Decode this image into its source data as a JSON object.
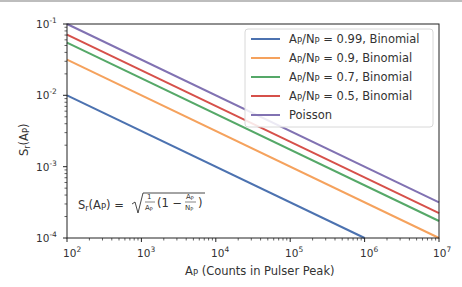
{
  "chart_data": {
    "type": "line",
    "title": "",
    "xlabel": "A_P (Counts in Pulser Peak)",
    "ylabel": "S_r(A_P)",
    "xscale": "log",
    "yscale": "log",
    "xlim": [
      100,
      10000000
    ],
    "ylim": [
      0.0001,
      0.1
    ],
    "x_ticks": [
      "10^2",
      "10^3",
      "10^4",
      "10^5",
      "10^6",
      "10^7"
    ],
    "y_ticks": [
      "10^-4",
      "10^-3",
      "10^-2",
      "10^-1"
    ],
    "grid": false,
    "legend_position": "upper right",
    "annotation": "S_r(A_P) = sqrt( (1/A_P) (1 - A_P/N_P) )",
    "x": [
      100,
      1000,
      10000,
      100000,
      1000000,
      10000000
    ],
    "series": [
      {
        "name": "A_P/N_P = 0.99, Binomial",
        "color": "#4c72b0",
        "values": [
          0.01,
          0.003162,
          0.001,
          0.0003162,
          0.0001,
          3.16e-05
        ]
      },
      {
        "name": "A_P/N_P = 0.9, Binomial",
        "color": "#f5a25d",
        "values": [
          0.03162,
          0.01,
          0.003162,
          0.001,
          0.0003162,
          0.0001
        ]
      },
      {
        "name": "A_P/N_P = 0.7, Binomial",
        "color": "#55a868",
        "values": [
          0.05477,
          0.01732,
          0.005477,
          0.001732,
          0.0005477,
          0.0001732
        ]
      },
      {
        "name": "A_P/N_P = 0.5, Binomial",
        "color": "#d6504a",
        "values": [
          0.07071,
          0.02236,
          0.007071,
          0.002236,
          0.0007071,
          0.0002236
        ]
      },
      {
        "name": "Poisson",
        "color": "#8172b2",
        "values": [
          0.1,
          0.03162,
          0.01,
          0.003162,
          0.001,
          0.0003162
        ]
      }
    ]
  },
  "axes": {
    "x_tick_bases": [
      "10",
      "10",
      "10",
      "10",
      "10",
      "10"
    ],
    "x_tick_exps": [
      "2",
      "3",
      "4",
      "5",
      "6",
      "7"
    ],
    "y_tick_bases": [
      "10",
      "10",
      "10",
      "10"
    ],
    "y_tick_exps": [
      "-1",
      "-2",
      "-3",
      "-4"
    ],
    "xlabel_main": "A",
    "xlabel_sub": "P",
    "xlabel_rest": " (Counts in Pulser Peak)",
    "ylabel_main": "S",
    "ylabel_sub_r": "r",
    "ylabel_paren_open": "(A",
    "ylabel_sub_p": "P",
    "ylabel_paren_close": ")"
  },
  "legend": {
    "items": [
      {
        "prefix": "A",
        "sub1": "P",
        "mid": "/N",
        "sub2": "P",
        "suffix": " = 0.99, Binomial"
      },
      {
        "prefix": "A",
        "sub1": "P",
        "mid": "/N",
        "sub2": "P",
        "suffix": " = 0.9, Binomial"
      },
      {
        "prefix": "A",
        "sub1": "P",
        "mid": "/N",
        "sub2": "P",
        "suffix": " = 0.7, Binomial"
      },
      {
        "prefix": "A",
        "sub1": "P",
        "mid": "/N",
        "sub2": "P",
        "suffix": " = 0.5, Binomial"
      },
      {
        "label": "Poisson"
      }
    ]
  },
  "formula": {
    "lhs_s": "S",
    "lhs_r": "r",
    "lhs_open": "(A",
    "lhs_p": "P",
    "lhs_close": ") =",
    "frac1_num": "1",
    "frac1_den": "A",
    "frac1_den_sub": "P",
    "middle": "(1 −",
    "frac2_num": "A",
    "frac2_num_sub": "P",
    "frac2_den": "N",
    "frac2_den_sub": "P",
    "close": ")"
  }
}
